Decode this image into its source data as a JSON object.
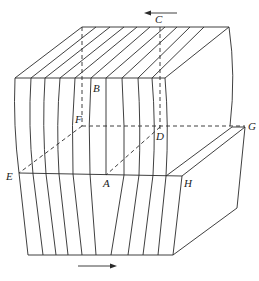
{
  "diagram": {
    "labels": {
      "A": "A",
      "B": "B",
      "C": "C",
      "D": "D",
      "E": "E",
      "F": "F",
      "G": "G",
      "H": "H"
    },
    "arrows": {
      "top": "left",
      "bottom": "right"
    },
    "colors": {
      "line": "#2a2a2a",
      "background": "#ffffff"
    }
  }
}
